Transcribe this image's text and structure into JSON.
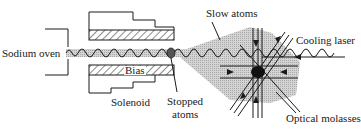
{
  "diagram": {
    "labels": {
      "oven": "Sodium oven",
      "bias": "Bias",
      "solenoid": "Solenoid",
      "stopped_line1": "Stopped",
      "stopped_line2": "atoms",
      "slow_atoms": "Slow atoms",
      "cooling_laser": "Cooling laser",
      "molasses": "Optical molasses"
    },
    "colors": {
      "ink": "#1a1a1a",
      "beam_shade": "#c8c8c8",
      "stopped_atoms": "#555555",
      "molasses_core": "#111111"
    }
  }
}
